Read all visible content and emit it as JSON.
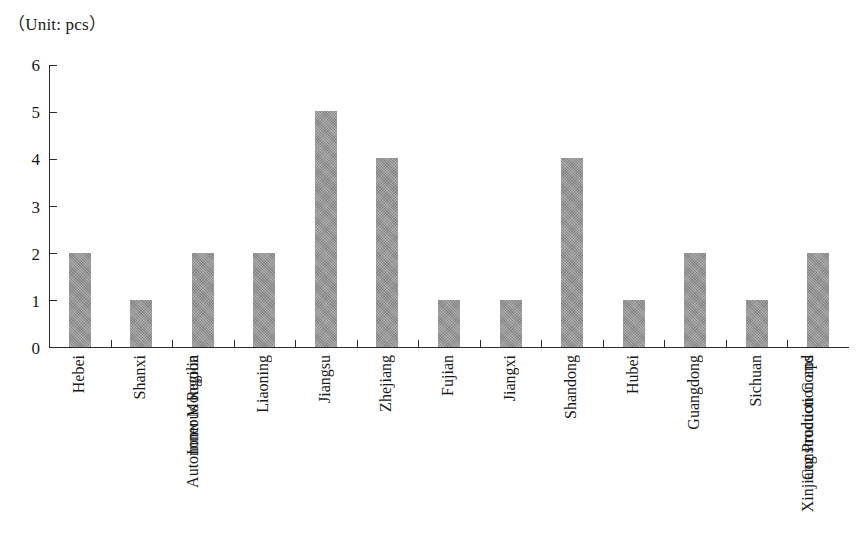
{
  "chart_data": {
    "type": "bar",
    "title": "（Unit: pcs）",
    "xlabel": "",
    "ylabel": "",
    "ylim": [
      0,
      6
    ],
    "yticks": [
      0,
      1,
      2,
      3,
      4,
      5,
      6
    ],
    "grid": false,
    "legend": null,
    "bar_color": "#919191",
    "axis_color": "#2b2b2b",
    "categories": [
      "Hebei",
      "Shanxi",
      "Inner Mongolia\nAutonomous Region",
      "Liaoning",
      "Jiangsu",
      "Zhejiang",
      "Fujian",
      "Jiangxi",
      "Shandong",
      "Hubei",
      "Guangdong",
      "Sichuan",
      "Xinjiang Production and\nConstruction Corps"
    ],
    "values": [
      2,
      1,
      2,
      2,
      5,
      4,
      1,
      1,
      4,
      1,
      2,
      1,
      2
    ]
  }
}
